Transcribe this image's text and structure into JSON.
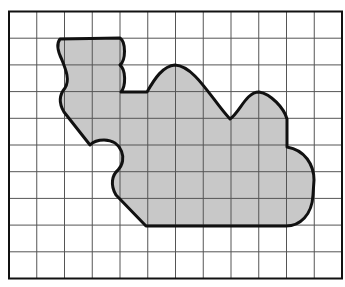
{
  "figure": {
    "title": "Irregular shaded shape on a square grid",
    "grid": {
      "columns": 12,
      "rows": 10,
      "left": 9,
      "top": 11.5,
      "right": 342,
      "bottom": 278.5,
      "line_color": "#555555",
      "border_color": "#111111"
    },
    "shape": {
      "fill_color": "#c8c8c8",
      "stroke_color": "#111111",
      "description": "Closed curved region covering multiple grid squares"
    },
    "colors": {
      "background": "#ffffff",
      "grid_line": "#555555",
      "outline": "#111111",
      "fill": "#c8c8c8"
    }
  }
}
